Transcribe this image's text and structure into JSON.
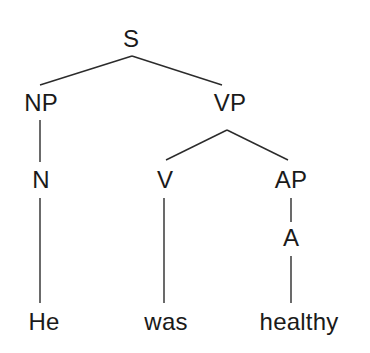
{
  "diagram": {
    "type": "syntax-tree",
    "sentence": "He was healthy",
    "background_color": "#ffffff",
    "line_color": "#2b2b2b",
    "text_color": "#1a1a1a",
    "nodes": [
      {
        "id": "S",
        "label": "S",
        "x": 131,
        "y": 39,
        "kind": "nonterminal"
      },
      {
        "id": "NP",
        "label": "NP",
        "x": 41,
        "y": 103,
        "kind": "nonterminal"
      },
      {
        "id": "VP",
        "label": "VP",
        "x": 230,
        "y": 103,
        "kind": "nonterminal"
      },
      {
        "id": "N",
        "label": "N",
        "x": 41,
        "y": 180,
        "kind": "nonterminal"
      },
      {
        "id": "V",
        "label": "V",
        "x": 165,
        "y": 180,
        "kind": "nonterminal"
      },
      {
        "id": "AP",
        "label": "AP",
        "x": 291,
        "y": 180,
        "kind": "nonterminal"
      },
      {
        "id": "A",
        "label": "A",
        "x": 291,
        "y": 238,
        "kind": "nonterminal"
      },
      {
        "id": "w1",
        "label": "He",
        "x": 44,
        "y": 322,
        "kind": "terminal"
      },
      {
        "id": "w2",
        "label": "was",
        "x": 166,
        "y": 322,
        "kind": "terminal"
      },
      {
        "id": "w3",
        "label": "healthy",
        "x": 299,
        "y": 322,
        "kind": "terminal"
      }
    ],
    "edges": [
      {
        "from": "S",
        "to": "NP",
        "x1": 132,
        "y1": 56,
        "x2": 40,
        "y2": 85
      },
      {
        "from": "S",
        "to": "VP",
        "x1": 132,
        "y1": 56,
        "x2": 222,
        "y2": 85
      },
      {
        "from": "NP",
        "to": "N",
        "x1": 40,
        "y1": 120,
        "x2": 40,
        "y2": 162
      },
      {
        "from": "VP",
        "to": "V",
        "x1": 227,
        "y1": 130,
        "x2": 166,
        "y2": 160
      },
      {
        "from": "VP",
        "to": "AP",
        "x1": 227,
        "y1": 130,
        "x2": 288,
        "y2": 160
      },
      {
        "from": "N",
        "to": "w1",
        "x1": 40,
        "y1": 198,
        "x2": 40,
        "y2": 303
      },
      {
        "from": "V",
        "to": "w2",
        "x1": 164,
        "y1": 198,
        "x2": 164,
        "y2": 303
      },
      {
        "from": "AP",
        "to": "A",
        "x1": 291,
        "y1": 198,
        "x2": 291,
        "y2": 222
      },
      {
        "from": "A",
        "to": "w3",
        "x1": 291,
        "y1": 256,
        "x2": 291,
        "y2": 303
      }
    ]
  }
}
